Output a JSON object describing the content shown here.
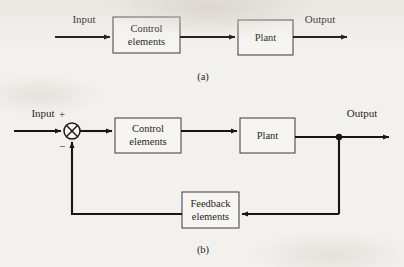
{
  "figure": {
    "background_color": "#f3f1ee",
    "ink_color": "#161616",
    "panels": [
      {
        "caption": "(a)",
        "caption_x": 203,
        "caption_y": 80,
        "blocks": [
          {
            "label_line1": "Control",
            "label_line2": "elements",
            "x": 113,
            "y": 17,
            "w": 67,
            "h": 36
          },
          {
            "label_line1": "Plant",
            "label_line2": "",
            "x": 238,
            "y": 20,
            "w": 55,
            "h": 35
          }
        ],
        "wire_labels": [
          {
            "text": "Input",
            "x": 84,
            "y": 23
          },
          {
            "text": "Output",
            "x": 320,
            "y": 23
          }
        ]
      },
      {
        "caption": "(b)",
        "caption_x": 203,
        "caption_y": 253,
        "blocks": [
          {
            "label_line1": "Control",
            "label_line2": "elements",
            "x": 115,
            "y": 118,
            "w": 66,
            "h": 35
          },
          {
            "label_line1": "Plant",
            "label_line2": "",
            "x": 240,
            "y": 118,
            "w": 55,
            "h": 35
          },
          {
            "label_line1": "Feedback",
            "label_line2": "elements",
            "x": 182,
            "y": 192,
            "w": 57,
            "h": 36
          }
        ],
        "wire_labels": [
          {
            "text": "Input",
            "x": 43,
            "y": 117
          },
          {
            "text": "Output",
            "x": 362,
            "y": 117
          }
        ],
        "summing_junction": {
          "center_x": 72,
          "center_y": 131,
          "radius": 8,
          "plus_sign": "+",
          "plus_x": 62,
          "plus_y": 115,
          "minus_sign": "−",
          "minus_x": 62,
          "minus_y": 148
        },
        "takeoff_dot": {
          "x": 339,
          "y": 137
        }
      }
    ]
  }
}
